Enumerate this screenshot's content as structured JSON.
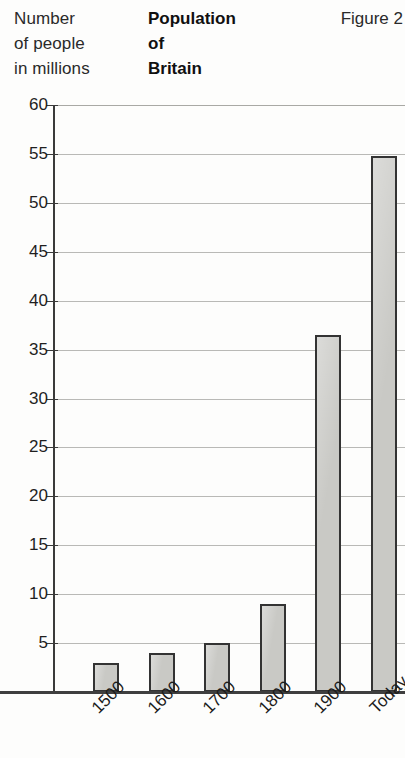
{
  "header": {
    "axis_caption_lines": [
      "Number",
      "of people",
      "in millions"
    ],
    "title_lines": [
      "Population",
      "of",
      "Britain"
    ],
    "figure_label": "Figure 2"
  },
  "chart_data": {
    "type": "bar",
    "title": "Population of Britain",
    "xlabel": "",
    "ylabel": "Number of people in millions",
    "categories": [
      "1500",
      "1600",
      "1700",
      "1800",
      "1900",
      "Today"
    ],
    "values": [
      3,
      4,
      5,
      9,
      36.5,
      54.8
    ],
    "ylim": [
      0,
      60
    ],
    "yticks": [
      5,
      10,
      15,
      20,
      25,
      30,
      35,
      40,
      45,
      50,
      55,
      60
    ],
    "ytick_labels": [
      "5",
      "10",
      "15",
      "20",
      "25",
      "30",
      "35",
      "40",
      "45",
      "50",
      "55",
      "60"
    ],
    "grid": true,
    "legend": null,
    "bar_fill_color": "#c9c9c5",
    "bar_border_color": "#333333",
    "gridline_color": "#b9b9b6",
    "axis_color": "#3a3a3a",
    "xlabel_rotation": -45
  }
}
